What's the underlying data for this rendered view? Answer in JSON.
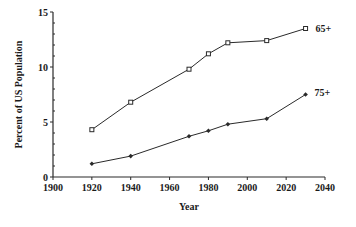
{
  "chart_data": {
    "type": "line",
    "title": "",
    "xlabel": "Year",
    "ylabel": "Percent of US Population",
    "xlim": [
      1900,
      2040
    ],
    "ylim": [
      0,
      15
    ],
    "x_ticks": [
      1900,
      1920,
      1940,
      1960,
      1980,
      2000,
      2020,
      2040
    ],
    "y_ticks": [
      0,
      5,
      10,
      15
    ],
    "x_tick_labels": [
      "1900",
      "1920",
      "1940",
      "1960",
      "1980",
      "2000",
      "2020",
      "2040"
    ],
    "y_tick_labels": [
      "0",
      "5",
      "10",
      "15"
    ],
    "grid": false,
    "legend": "inline labels at line ends",
    "series": [
      {
        "name": "65+",
        "marker": "open-square",
        "x": [
          1920,
          1940,
          1970,
          1980,
          1990,
          2010,
          2030
        ],
        "values": [
          4.3,
          6.8,
          9.8,
          11.2,
          12.2,
          12.4,
          13.5
        ]
      },
      {
        "name": "75+",
        "marker": "filled-diamond",
        "x": [
          1920,
          1940,
          1970,
          1980,
          1990,
          2010,
          2030
        ],
        "values": [
          1.2,
          1.9,
          3.7,
          4.2,
          4.8,
          5.3,
          7.5
        ]
      }
    ]
  }
}
